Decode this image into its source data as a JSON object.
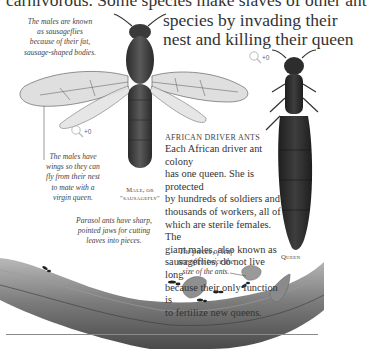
{
  "headline": {
    "line0": "carnivorous. Some species make slaves of other ant",
    "line1": "species by invading their",
    "line2": "nest and killing their queen"
  },
  "captions": {
    "sausageflies": [
      "The males are known",
      "as sausageflies",
      "because of their fat,",
      "sausage-shaped bodies."
    ],
    "wings": [
      "The males have",
      "wings so they can",
      "fly from their nest",
      "to mate with a",
      "virgin queen."
    ],
    "parasol": [
      "Parasol ants have sharp,",
      "pointed jaws for cutting",
      "leaves into pieces."
    ],
    "leaf": [
      "The pieces of leaf",
      "are often twice the",
      "size of the ants."
    ]
  },
  "labels": {
    "male": [
      "Male, or",
      "\"sausagefly\""
    ],
    "queen": "Queen"
  },
  "zoom_indicators": [
    {
      "icon": "magnifier-icon",
      "label": "+0"
    },
    {
      "icon": "magnifier-icon",
      "label": "+0"
    },
    {
      "icon": "magnifier-icon",
      "label": "+0"
    }
  ],
  "article": {
    "heading": "African driver ants",
    "lines": [
      "Each African driver ant colony",
      "has one queen. She is protected",
      "by hundreds of soldiers and",
      "thousands of workers, all of",
      "which are sterile females. The",
      "giant males, also known as",
      "sausageflies, do not live long",
      "because their only function is",
      "to fertilize new queens."
    ]
  }
}
